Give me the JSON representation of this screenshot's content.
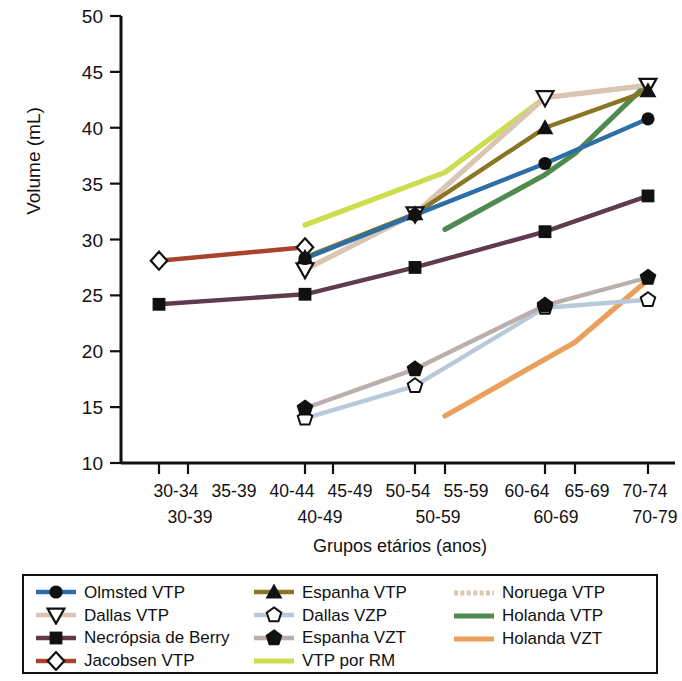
{
  "chart_data": {
    "type": "line",
    "title": "",
    "xlabel": "Grupos etários (anos)",
    "ylabel": "Volume (mL)",
    "ylim": [
      10,
      50
    ],
    "yticks": [
      10,
      15,
      20,
      25,
      30,
      35,
      40,
      45,
      50
    ],
    "grid": false,
    "legend_position": "bottom",
    "x_axis": {
      "primary_categories": [
        "30-34",
        "35-39",
        "40-44",
        "45-49",
        "50-54",
        "55-59",
        "60-64",
        "65-69",
        "70-74"
      ],
      "secondary_categories": [
        "30-39",
        "40-49",
        "50-59",
        "60-69",
        "70-79"
      ]
    },
    "series": [
      {
        "name": "Olmsted VTP",
        "color": "#2e6ea6",
        "marker": "circle-filled",
        "points": [
          {
            "x": "40-44",
            "y": 28.3
          },
          {
            "x": "50-54",
            "y": 32.2
          },
          {
            "x": "60-64",
            "y": 36.8
          },
          {
            "x": "70-74",
            "y": 40.8
          }
        ]
      },
      {
        "name": "Dallas VTP",
        "color": "#d9c6b2",
        "marker": "triangle-down-open",
        "points": [
          {
            "x": "40-44",
            "y": 27.3
          },
          {
            "x": "50-54",
            "y": 32.3
          },
          {
            "x": "60-64",
            "y": 42.7
          },
          {
            "x": "70-74",
            "y": 43.8
          }
        ]
      },
      {
        "name": "Necrópsia de Berry",
        "color": "#5e3b4d",
        "marker": "square-filled",
        "points": [
          {
            "x": "30-34",
            "y": 24.2
          },
          {
            "x": "40-44",
            "y": 25.1
          },
          {
            "x": "50-54",
            "y": 27.5
          },
          {
            "x": "60-64",
            "y": 30.7
          },
          {
            "x": "70-74",
            "y": 33.9
          }
        ]
      },
      {
        "name": "Jacobsen VTP",
        "color": "#a8432c",
        "marker": "diamond-open",
        "points": [
          {
            "x": "30-34",
            "y": 28.1
          },
          {
            "x": "40-44",
            "y": 29.3
          }
        ]
      },
      {
        "name": "Espanha VTP",
        "color": "#8a7524",
        "marker": "triangle-up-filled",
        "points": [
          {
            "x": "40-44",
            "y": 28.4
          },
          {
            "x": "50-54",
            "y": 32.3
          },
          {
            "x": "60-64",
            "y": 40.0
          },
          {
            "x": "70-74",
            "y": 43.3
          }
        ]
      },
      {
        "name": "Dallas VZP",
        "color": "#b8cada",
        "marker": "pentagon-open",
        "points": [
          {
            "x": "40-44",
            "y": 14.0
          },
          {
            "x": "50-54",
            "y": 16.9
          },
          {
            "x": "60-64",
            "y": 23.9
          },
          {
            "x": "70-74",
            "y": 24.6
          }
        ]
      },
      {
        "name": "Espanha VZT",
        "color": "#b9b0ad",
        "marker": "pentagon-filled",
        "points": [
          {
            "x": "40-44",
            "y": 14.9
          },
          {
            "x": "50-54",
            "y": 18.4
          },
          {
            "x": "60-64",
            "y": 24.1
          },
          {
            "x": "70-74",
            "y": 26.6
          }
        ]
      },
      {
        "name": "VTP por RM",
        "color": "#ccde4e",
        "marker": "none",
        "points": [
          {
            "x": "40-44",
            "y": 31.3
          },
          {
            "x": "55-59",
            "y": 36.0
          },
          {
            "x": "60-64",
            "y": 42.7
          }
        ]
      },
      {
        "name": "Noruega VTP",
        "color": "#d9c6b2",
        "marker": "none",
        "points": [
          {
            "x": "40-44",
            "y": 27.3
          },
          {
            "x": "50-54",
            "y": 32.3
          },
          {
            "x": "60-64",
            "y": 42.7
          },
          {
            "x": "70-74",
            "y": 43.8
          }
        ]
      },
      {
        "name": "Holanda VTP",
        "color": "#4f8a50",
        "marker": "none",
        "points": [
          {
            "x": "55-59",
            "y": 30.9
          },
          {
            "x": "60-64",
            "y": 35.8
          },
          {
            "x": "65-69",
            "y": 37.7
          },
          {
            "x": "70-74",
            "y": 44.0
          }
        ]
      },
      {
        "name": "Holanda VZT",
        "color": "#e8a05c",
        "marker": "none",
        "points": [
          {
            "x": "55-59",
            "y": 14.2
          },
          {
            "x": "65-69",
            "y": 20.8
          },
          {
            "x": "70-74",
            "y": 26.4
          }
        ]
      }
    ]
  },
  "axes": {
    "ylabel": "Volume (mL)",
    "xlabel": "Grupos etários (anos)",
    "yticks": [
      "50",
      "45",
      "40",
      "35",
      "30",
      "25",
      "20",
      "15",
      "10"
    ],
    "xticks_primary": [
      "30-34",
      "35-39",
      "40-44",
      "45-49",
      "50-54",
      "55-59",
      "60-64",
      "65-69",
      "70-74"
    ],
    "xticks_secondary": [
      "30-39",
      "40-49",
      "50-59",
      "60-69",
      "70-79"
    ]
  },
  "legend": {
    "columns": [
      {
        "items": [
          {
            "label": "Olmsted VTP",
            "color": "#2e6ea6",
            "marker": "circle-filled"
          },
          {
            "label": "Dallas VTP",
            "color": "#d9c6b2",
            "marker": "triangle-down-open"
          },
          {
            "label": "Necrópsia de Berry",
            "color": "#5e3b4d",
            "marker": "square-filled"
          },
          {
            "label": "Jacobsen VTP",
            "color": "#a8432c",
            "marker": "diamond-open"
          }
        ]
      },
      {
        "items": [
          {
            "label": "Espanha VTP",
            "color": "#8a7524",
            "marker": "triangle-up-filled"
          },
          {
            "label": "Dallas VZP",
            "color": "#b8cada",
            "marker": "pentagon-open"
          },
          {
            "label": "Espanha VZT",
            "color": "#b9b0ad",
            "marker": "pentagon-filled"
          },
          {
            "label": "VTP por RM",
            "color": "#ccde4e",
            "marker": "none"
          }
        ]
      },
      {
        "items": [
          {
            "label": "Noruega VTP",
            "color": "#d9c6b2",
            "marker": "none-dashed"
          },
          {
            "label": "Holanda VTP",
            "color": "#4f8a50",
            "marker": "none"
          },
          {
            "label": "Holanda VZT",
            "color": "#e8a05c",
            "marker": "none"
          }
        ]
      }
    ]
  }
}
